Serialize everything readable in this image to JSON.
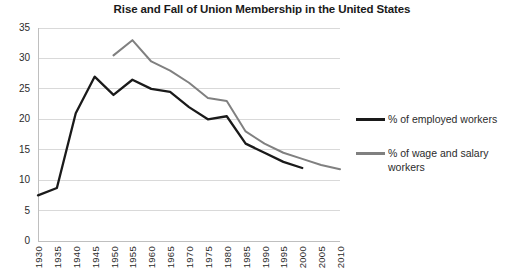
{
  "chart_data": {
    "type": "line",
    "title": "Rise and Fall of Union Membership in the United States",
    "xlabel": "",
    "ylabel": "",
    "xlim": [
      1930,
      2010
    ],
    "ylim": [
      0,
      35
    ],
    "ytick_step": 5,
    "xtick_step": 5,
    "grid": true,
    "legend_position": "right",
    "categories": [
      1930,
      1935,
      1940,
      1945,
      1950,
      1955,
      1960,
      1965,
      1970,
      1975,
      1980,
      1985,
      1990,
      1995,
      2000,
      2005,
      2010
    ],
    "ytick_labels": [
      "35",
      "30",
      "25",
      "20",
      "15",
      "10",
      "5",
      "0"
    ],
    "xtick_labels": [
      "1930",
      "1935",
      "1940",
      "1945",
      "1950",
      "1955",
      "1960",
      "1965",
      "1970",
      "1975",
      "1980",
      "1985",
      "1990",
      "1995",
      "2000",
      "2005",
      "2010"
    ],
    "series": [
      {
        "name": "% of employed workers",
        "color": "#1a1a1a",
        "x": [
          1930,
          1935,
          1940,
          1945,
          1950,
          1955,
          1960,
          1965,
          1970,
          1975,
          1980,
          1985,
          1990,
          1995,
          2000
        ],
        "values": [
          7.5,
          8.7,
          21.0,
          27.0,
          24.0,
          26.5,
          25.0,
          24.5,
          22.0,
          20.0,
          20.5,
          16.0,
          14.5,
          13.0,
          12.0
        ]
      },
      {
        "name": "% of wage and salary workers",
        "color": "#808080",
        "x": [
          1950,
          1955,
          1960,
          1965,
          1970,
          1975,
          1980,
          1985,
          1990,
          1995,
          2000,
          2005,
          2010
        ],
        "values": [
          30.5,
          33.0,
          29.5,
          28.0,
          26.0,
          23.5,
          23.0,
          18.0,
          16.0,
          14.5,
          13.5,
          12.5,
          11.8
        ]
      }
    ]
  },
  "legend": {
    "entries": [
      {
        "label": "% of employed workers",
        "color": "#1a1a1a"
      },
      {
        "label": "% of wage and salary workers",
        "color": "#808080"
      }
    ]
  },
  "colors": {
    "employed": "#1a1a1a",
    "wage_salary": "#808080",
    "grid": "#d9d9d9",
    "axis": "#bfbfbf",
    "text": "#2b2b2b"
  }
}
